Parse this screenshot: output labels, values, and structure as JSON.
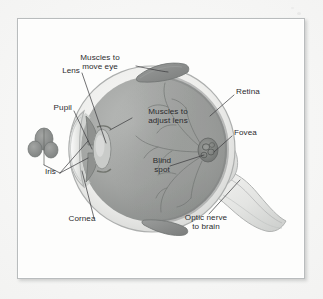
{
  "figure": {
    "medium": "scanned textbook illustration",
    "frame_color": "#b9bcbd",
    "page_color": "#fdfdfc",
    "ink_color": "#2b2b2e",
    "sclera_color": "#e9e9e7",
    "vitreous_color": "#9fa1a0",
    "muscle_color": "#8c8e8d",
    "labels": [
      {
        "id": "muscles-to-move-eye",
        "text": "Muscles to\nmove eye"
      },
      {
        "id": "lens",
        "text": "Lens"
      },
      {
        "id": "pupil",
        "text": "Pupil"
      },
      {
        "id": "iris",
        "text": "Iris"
      },
      {
        "id": "cornea",
        "text": "Cornea"
      },
      {
        "id": "muscles-to-adjust-lens",
        "text": "Muscles to\nadjust lens"
      },
      {
        "id": "blind-spot",
        "text": "Blind\nspot"
      },
      {
        "id": "retina",
        "text": "Retina"
      },
      {
        "id": "fovea",
        "text": "Fovea"
      },
      {
        "id": "optic-nerve-to-brain",
        "text": "Optic nerve\nto brain"
      }
    ]
  }
}
